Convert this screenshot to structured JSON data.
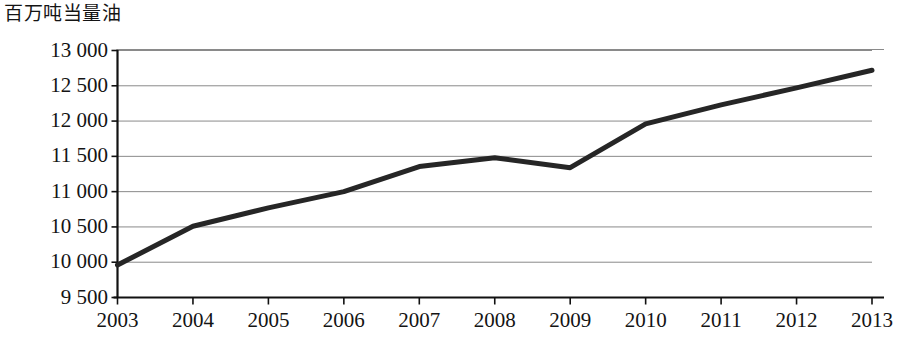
{
  "chart_data": {
    "type": "line",
    "title": "",
    "ylabel": "百万吨当量油",
    "xlabel": "",
    "categories": [
      "2003",
      "2004",
      "2005",
      "2006",
      "2007",
      "2008",
      "2009",
      "2010",
      "2011",
      "2012",
      "2013"
    ],
    "x": [
      2003,
      2004,
      2005,
      2006,
      2007,
      2008,
      2009,
      2010,
      2011,
      2012,
      2013
    ],
    "series": [
      {
        "name": "世界一次能源消费总量",
        "values": [
          9960,
          10510,
          10770,
          11000,
          11355,
          11480,
          11340,
          11960,
          12230,
          12470,
          12720
        ]
      }
    ],
    "values": [
      9960,
      10510,
      10770,
      11000,
      11355,
      11480,
      11340,
      11960,
      12230,
      12470,
      12720
    ],
    "ylim": [
      9500,
      13000
    ],
    "ytick_step": 500,
    "ytick_labels": [
      "13 000",
      "12 500",
      "12 000",
      "11 500",
      "11 000",
      "10 500",
      "10 000",
      "9 500"
    ],
    "ytick_values": [
      13000,
      12500,
      12000,
      11500,
      11000,
      10500,
      10000,
      9500
    ],
    "grid": true,
    "legend": "none",
    "line_color": "#262626",
    "grid_color": "#8a8a8a",
    "axis_color": "#111111",
    "background_color": "#ffffff"
  }
}
